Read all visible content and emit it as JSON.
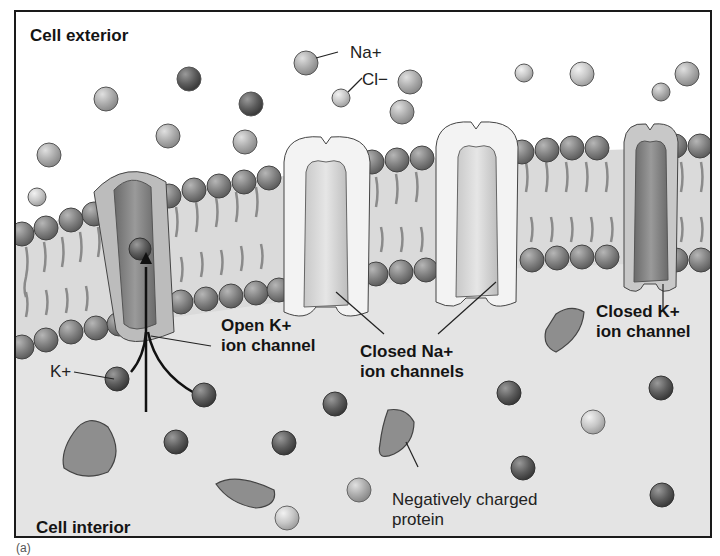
{
  "figure": {
    "panel_label": "(a)",
    "regions": {
      "exterior": "Cell exterior",
      "interior": "Cell interior"
    },
    "ion_labels": {
      "sodium": "Na+",
      "chloride": "Cl−",
      "potassium": "K+"
    },
    "callouts": {
      "open_k_channel": [
        "Open K+",
        "ion channel"
      ],
      "closed_na_channels": [
        "Closed Na+",
        "ion channels"
      ],
      "closed_k_channel": [
        "Closed K+",
        "ion channel"
      ],
      "negative_protein": [
        "Negatively charged",
        "protein"
      ]
    },
    "colors": {
      "exterior_bg": "#ffffff",
      "membrane_interior": "#dcdcdc",
      "cytoplasm": "#e6e6e6",
      "k_ion": "#5a5a5a",
      "na_ion": "#b0b0b0",
      "cl_ion": "#c4c4c4",
      "protein": "#8c8c8c",
      "na_channel": "#f2f2f2",
      "k_channel": "#7e7e7e"
    }
  }
}
